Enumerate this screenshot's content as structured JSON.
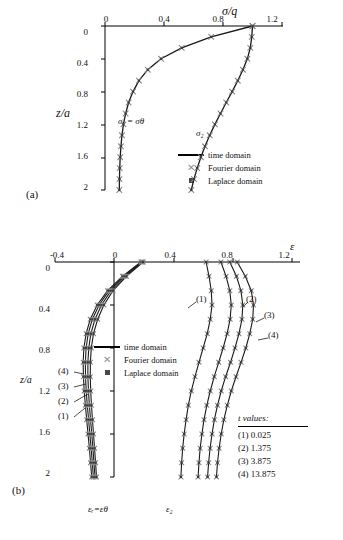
{
  "figure": {
    "panel_a_label": "(a)",
    "panel_b_label": "(b)"
  },
  "legend": {
    "time_domain": "time domain",
    "fourier_domain": "Fourier domain",
    "laplace_domain": "Laplace domain",
    "marker_line": "line",
    "marker_x": "✕",
    "marker_square": "■"
  },
  "t_values": {
    "title": "t values:",
    "rows": [
      "(1) 0.025",
      "(2) 1.375",
      "(3) 3.875",
      "(4) 13.875"
    ]
  },
  "chart_data": [
    {
      "type": "line",
      "panel": "(a)",
      "title": "",
      "xlabel": "σ/q",
      "ylabel": "z/a",
      "xlim": [
        0,
        1.2
      ],
      "ylim": [
        2,
        0
      ],
      "xticks": [
        "0",
        "0.4",
        "0.8",
        "1.2"
      ],
      "yticks": [
        "0",
        "0.4",
        "0.8",
        "1.2",
        "1.6",
        "2"
      ],
      "grid": false,
      "legend_position": "center-right",
      "annotations": [
        {
          "text": "σᵣ = σθ",
          "x": 0.22,
          "y": 1.0
        },
        {
          "text": "σ₂",
          "x": 0.72,
          "y": 1.18
        }
      ],
      "series": [
        {
          "name": "sigma_r = sigma_theta",
          "x": [
            1.0,
            0.72,
            0.52,
            0.38,
            0.29,
            0.23,
            0.19,
            0.16,
            0.14,
            0.125,
            0.115,
            0.108,
            0.103,
            0.1,
            0.098,
            0.097
          ],
          "y": [
            0,
            0.133,
            0.267,
            0.4,
            0.533,
            0.667,
            0.8,
            0.933,
            1.067,
            1.2,
            1.333,
            1.467,
            1.6,
            1.733,
            1.867,
            2.0
          ]
        },
        {
          "name": "sigma_z",
          "x": [
            1.0,
            0.995,
            0.985,
            0.965,
            0.935,
            0.9,
            0.862,
            0.822,
            0.783,
            0.745,
            0.71,
            0.678,
            0.65,
            0.625,
            0.603,
            0.585
          ],
          "y": [
            0,
            0.133,
            0.267,
            0.4,
            0.533,
            0.667,
            0.8,
            0.933,
            1.067,
            1.2,
            1.333,
            1.467,
            1.6,
            1.733,
            1.867,
            2.0
          ]
        }
      ]
    },
    {
      "type": "line",
      "panel": "(b)",
      "title": "",
      "xlabel": "ε",
      "ylabel": "z/a",
      "xlim": [
        -0.4,
        1.2
      ],
      "ylim": [
        2,
        0
      ],
      "xticks": [
        "-0.4",
        "0",
        "0.4",
        "0.8",
        "1.2"
      ],
      "yticks": [
        "0",
        "0.4",
        "0.8",
        "1.2",
        "1.6",
        "2"
      ],
      "grid": false,
      "legend_position": "center-left",
      "annotations": [
        {
          "text": "(1)",
          "x": 0.62,
          "y": 0.3
        },
        {
          "text": "(2)",
          "x": 0.97,
          "y": 0.3
        },
        {
          "text": "(3)",
          "x": 1.04,
          "y": 0.46
        },
        {
          "text": "(4)",
          "x": 1.04,
          "y": 0.66
        },
        {
          "text": "(4)",
          "x": -0.2,
          "y": 1.02
        },
        {
          "text": "(3)",
          "x": -0.2,
          "y": 1.17
        },
        {
          "text": "(2)",
          "x": -0.2,
          "y": 1.32
        },
        {
          "text": "(1)",
          "x": -0.2,
          "y": 1.47
        },
        {
          "text": "εᵣ=εθ",
          "x": -0.1,
          "y": 2.12
        },
        {
          "text": "ε₂",
          "x": 0.5,
          "y": 2.12
        }
      ],
      "series": [
        {
          "name": "eps_z t=0.025",
          "x": [
            0.62,
            0.64,
            0.655,
            0.66,
            0.648,
            0.628,
            0.6,
            0.572,
            0.545,
            0.52,
            0.5,
            0.485,
            0.472,
            0.462,
            0.455,
            0.45
          ],
          "y": [
            0,
            0.133,
            0.267,
            0.4,
            0.533,
            0.667,
            0.8,
            0.933,
            1.067,
            1.2,
            1.333,
            1.467,
            1.6,
            1.733,
            1.867,
            2.0
          ]
        },
        {
          "name": "eps_z t=1.375",
          "x": [
            0.72,
            0.755,
            0.78,
            0.79,
            0.782,
            0.762,
            0.735,
            0.705,
            0.675,
            0.648,
            0.625,
            0.606,
            0.592,
            0.58,
            0.572,
            0.566
          ],
          "y": [
            0,
            0.133,
            0.267,
            0.4,
            0.533,
            0.667,
            0.8,
            0.933,
            1.067,
            1.2,
            1.333,
            1.467,
            1.6,
            1.733,
            1.867,
            2.0
          ]
        },
        {
          "name": "eps_z t=3.875",
          "x": [
            0.78,
            0.825,
            0.855,
            0.868,
            0.862,
            0.842,
            0.815,
            0.785,
            0.752,
            0.722,
            0.697,
            0.676,
            0.66,
            0.647,
            0.637,
            0.63
          ],
          "y": [
            0,
            0.133,
            0.267,
            0.4,
            0.533,
            0.667,
            0.8,
            0.933,
            1.067,
            1.2,
            1.333,
            1.467,
            1.6,
            1.733,
            1.867,
            2.0
          ]
        },
        {
          "name": "eps_z t=13.875",
          "x": [
            0.83,
            0.885,
            0.925,
            0.94,
            0.935,
            0.915,
            0.888,
            0.856,
            0.822,
            0.79,
            0.763,
            0.74,
            0.722,
            0.708,
            0.697,
            0.69
          ],
          "y": [
            0,
            0.133,
            0.267,
            0.4,
            0.533,
            0.667,
            0.8,
            0.933,
            1.067,
            1.2,
            1.333,
            1.467,
            1.6,
            1.733,
            1.867,
            2.0
          ]
        },
        {
          "name": "eps_r t=0.025",
          "x": [
            0.18,
            0.055,
            -0.045,
            -0.115,
            -0.162,
            -0.19,
            -0.205,
            -0.21,
            -0.208,
            -0.203,
            -0.195,
            -0.186,
            -0.177,
            -0.168,
            -0.16,
            -0.152
          ],
          "y": [
            0,
            0.133,
            0.267,
            0.4,
            0.533,
            0.667,
            0.8,
            0.933,
            1.067,
            1.2,
            1.333,
            1.467,
            1.6,
            1.733,
            1.867,
            2.0
          ]
        },
        {
          "name": "eps_r t=1.375",
          "x": [
            0.185,
            0.062,
            -0.035,
            -0.102,
            -0.148,
            -0.176,
            -0.19,
            -0.195,
            -0.194,
            -0.189,
            -0.182,
            -0.173,
            -0.165,
            -0.156,
            -0.148,
            -0.141
          ],
          "y": [
            0,
            0.133,
            0.267,
            0.4,
            0.533,
            0.667,
            0.8,
            0.933,
            1.067,
            1.2,
            1.333,
            1.467,
            1.6,
            1.733,
            1.867,
            2.0
          ]
        },
        {
          "name": "eps_r t=3.875",
          "x": [
            0.19,
            0.072,
            -0.022,
            -0.086,
            -0.13,
            -0.158,
            -0.172,
            -0.178,
            -0.178,
            -0.174,
            -0.168,
            -0.16,
            -0.152,
            -0.144,
            -0.137,
            -0.13
          ],
          "y": [
            0,
            0.133,
            0.267,
            0.4,
            0.533,
            0.667,
            0.8,
            0.933,
            1.067,
            1.2,
            1.333,
            1.467,
            1.6,
            1.733,
            1.867,
            2.0
          ]
        },
        {
          "name": "eps_r t=13.875",
          "x": [
            0.195,
            0.082,
            -0.008,
            -0.07,
            -0.112,
            -0.14,
            -0.155,
            -0.161,
            -0.162,
            -0.159,
            -0.154,
            -0.147,
            -0.14,
            -0.133,
            -0.126,
            -0.12
          ],
          "y": [
            0,
            0.133,
            0.267,
            0.4,
            0.533,
            0.667,
            0.8,
            0.933,
            1.067,
            1.2,
            1.333,
            1.467,
            1.6,
            1.733,
            1.867,
            2.0
          ]
        }
      ]
    }
  ]
}
